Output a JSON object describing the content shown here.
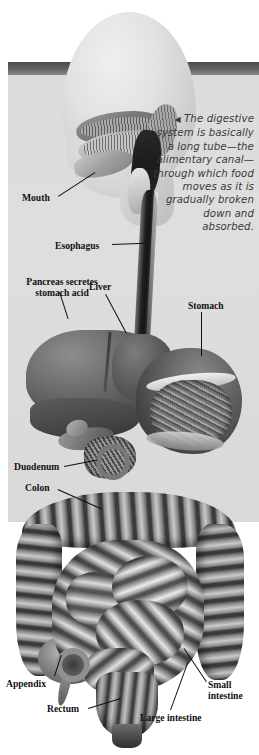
{
  "figure": {
    "caption": {
      "arrow": "◀",
      "text": "The digestive system is basically a long tube—the alimentary canal—through which food moves as it is gradually broken down and absorbed."
    },
    "labels": {
      "mouth": "Mouth",
      "esophagus": "Esophagus",
      "pancreas": "Pancreas secretes stomach acid",
      "liver": "Liver",
      "stomach": "Stomach",
      "duodenum": "Duodenum",
      "colon": "Colon",
      "appendix": "Appendix",
      "rectum": "Rectum",
      "large_intestine": "Large intestine",
      "small_intestine": "Small intestine"
    },
    "colors": {
      "page_background": "#ffffff",
      "panel_background": "#dcdcdc",
      "dark_band": "#4c4c4c",
      "label_text": "#111111",
      "caption_text": "#3a3a3a",
      "organ_dark": "#3a3a3a",
      "organ_mid": "#8c8c8c",
      "organ_light": "#e2e2e2"
    }
  }
}
